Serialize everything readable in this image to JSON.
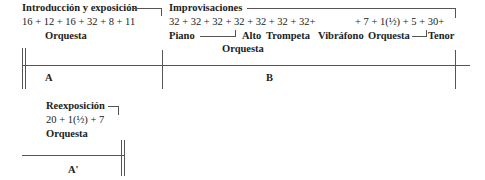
{
  "sections": {
    "intro": {
      "title": "Introducción y exposición",
      "bars": "16 + 12 + 16 + 32 + 8 + 11",
      "instrument": "Orquesta",
      "label": "A"
    },
    "improv": {
      "title": "Improvisaciones",
      "bars_a": "32 + 32 + 32 + 32 + 32 + 32 + 32+",
      "bars_b": "+ 7 + 1(½) + 5 + 30+",
      "instruments": [
        "Piano",
        "Alto",
        "Trompeta",
        "Vibráfono",
        "Orquesta",
        "Tenor"
      ],
      "instrument_sub": "Orquesta",
      "label": "B"
    },
    "reexpo": {
      "title": "Reexposición",
      "bars": "20 + 1(½) + 7",
      "instrument": "Orquesta",
      "label": "A'"
    }
  }
}
